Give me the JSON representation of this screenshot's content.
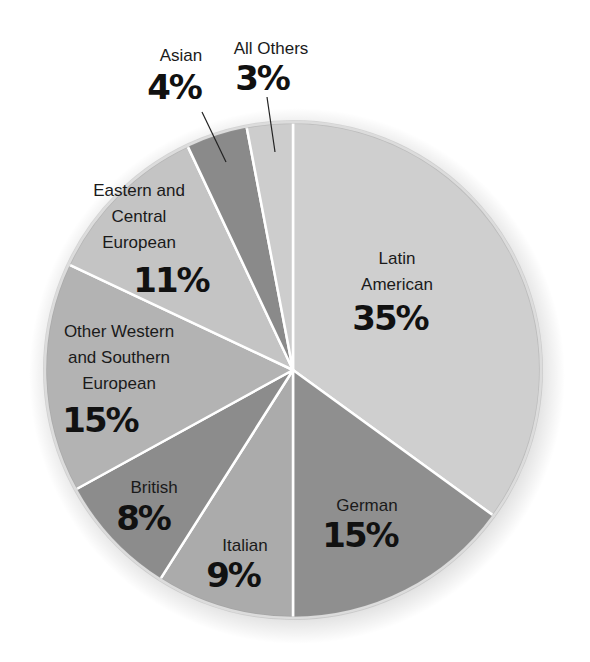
{
  "chart_data": {
    "type": "pie",
    "title": "",
    "start_angle": "12 o'clock, clockwise",
    "slices": [
      {
        "label": "Latin American",
        "value": 35,
        "display": "35%",
        "color": "#cfcfcf"
      },
      {
        "label": "German",
        "value": 15,
        "display": "15%",
        "color": "#8f8f8f"
      },
      {
        "label": "Italian",
        "value": 9,
        "display": "9%",
        "color": "#ababab"
      },
      {
        "label": "British",
        "value": 8,
        "display": "8%",
        "color": "#8c8c8c"
      },
      {
        "label": "Other Western and Southern European",
        "value": 15,
        "display": "15%",
        "color": "#b3b3b3"
      },
      {
        "label": "Eastern and Central European",
        "value": 11,
        "display": "11%",
        "color": "#c4c4c4"
      },
      {
        "label": "Asian",
        "value": 4,
        "display": "4%",
        "color": "#8a8a8a"
      },
      {
        "label": "All Others",
        "value": 3,
        "display": "3%",
        "color": "#cdcdcd"
      }
    ],
    "legend": "none (direct labels)"
  },
  "labels": {
    "latin": {
      "lines": [
        "Latin",
        "American"
      ],
      "pct": "35%"
    },
    "german": {
      "lines": [
        "German"
      ],
      "pct": "15%"
    },
    "italian": {
      "lines": [
        "Italian"
      ],
      "pct": "9%"
    },
    "british": {
      "lines": [
        "British"
      ],
      "pct": "8%"
    },
    "other_western": {
      "lines": [
        "Other Western",
        "and Southern",
        "European"
      ],
      "pct": "15%"
    },
    "eastern": {
      "lines": [
        "Eastern and",
        "Central",
        "European"
      ],
      "pct": "11%"
    },
    "asian": {
      "lines": [
        "Asian"
      ],
      "pct": "4%"
    },
    "all_others": {
      "lines": [
        "All Others"
      ],
      "pct": "3%"
    }
  }
}
